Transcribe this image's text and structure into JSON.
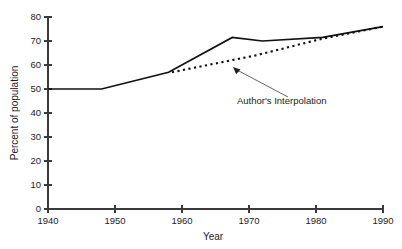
{
  "chart_data": {
    "type": "line",
    "title": "",
    "xlabel": "Year",
    "ylabel": "Percent of population",
    "xlim": [
      1940,
      1990
    ],
    "ylim": [
      0,
      80
    ],
    "xticks": [
      1940,
      1950,
      1960,
      1970,
      1980,
      1990
    ],
    "yticks": [
      0,
      10,
      20,
      30,
      40,
      50,
      60,
      70,
      80
    ],
    "grid": false,
    "legend": "none",
    "series": [
      {
        "name": "Reported data",
        "style": "solid",
        "x": [
          1940,
          1948,
          1958,
          1967.5,
          1972,
          1981,
          1990
        ],
        "values": [
          50,
          50,
          57,
          71.5,
          70,
          71.5,
          76
        ]
      },
      {
        "name": "Author's Interpolation",
        "style": "dotted",
        "x": [
          1958.5,
          1971,
          1981,
          1990
        ],
        "values": [
          57,
          64,
          71,
          76
        ]
      }
    ],
    "annotations": [
      {
        "text": "Author's Interpolation",
        "text_x": 237,
        "text_y": 104,
        "leader_from_x": 288,
        "leader_from_y": 97,
        "leader_to_x": 233,
        "leader_to_y": 67
      }
    ]
  },
  "axes_geometry": {
    "left": 48,
    "right": 383,
    "top": 17,
    "bottom": 209,
    "tick_length": 4
  }
}
